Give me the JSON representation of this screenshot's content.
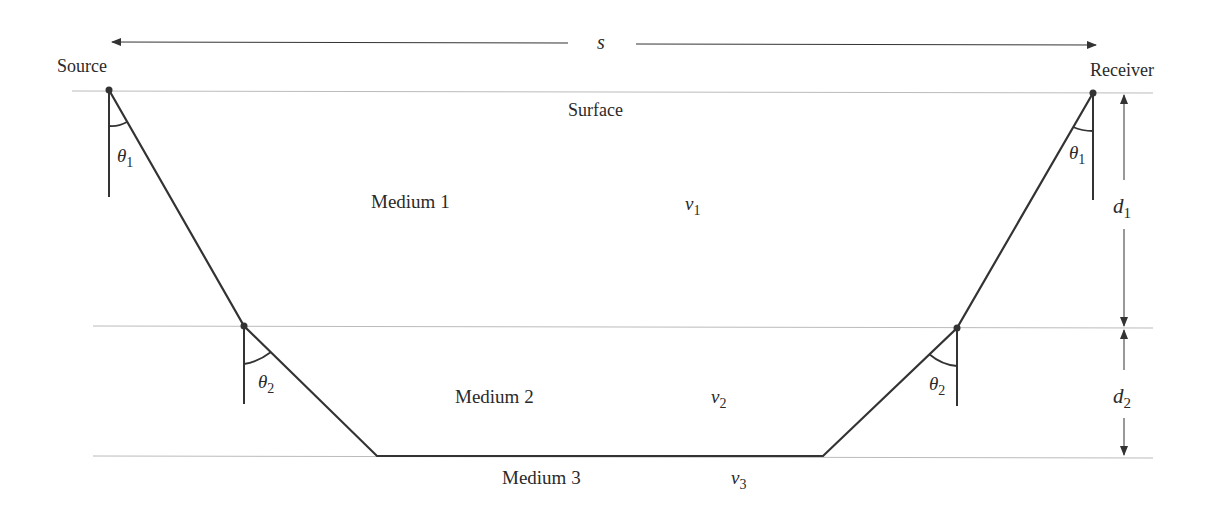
{
  "diagram": {
    "distance_label": "s",
    "source_label": "Source",
    "receiver_label": "Receiver",
    "surface_label": "Surface",
    "media": [
      {
        "name": "Medium 1",
        "velocity_symbol": "v",
        "velocity_sub": "1"
      },
      {
        "name": "Medium 2",
        "velocity_symbol": "v",
        "velocity_sub": "2"
      },
      {
        "name": "Medium 3",
        "velocity_symbol": "v",
        "velocity_sub": "3"
      }
    ],
    "angles": [
      {
        "symbol": "θ",
        "sub": "1"
      },
      {
        "symbol": "θ",
        "sub": "2"
      }
    ],
    "thickness": [
      {
        "symbol": "d",
        "sub": "1"
      },
      {
        "symbol": "d",
        "sub": "2"
      }
    ],
    "colors": {
      "ray": "#333333",
      "interface": "#bbbbbb",
      "text": "#2a2a2a"
    }
  }
}
